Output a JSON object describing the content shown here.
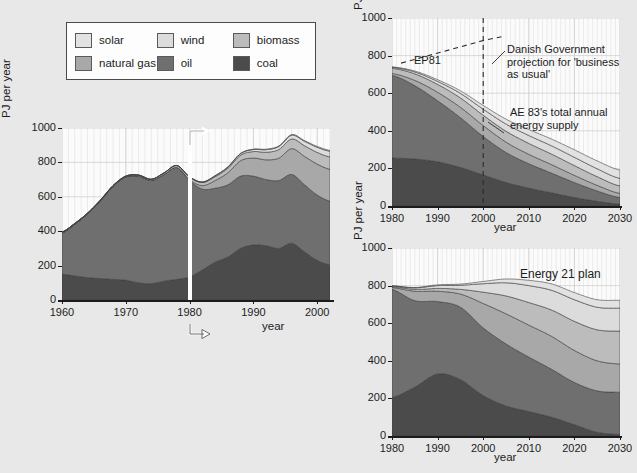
{
  "legend": {
    "name": "energy-source-legend",
    "rows": [
      [
        {
          "label": "solar",
          "color": "#e2e2e2",
          "icon": "swatch-solar"
        },
        {
          "label": "wind",
          "color": "#dcdcdc",
          "icon": "swatch-wind"
        },
        {
          "label": "biomass",
          "color": "#bcbcbc",
          "icon": "swatch-biomass"
        }
      ],
      [
        {
          "label": "natural gas",
          "color": "#a8a8a8",
          "icon": "swatch-natural-gas"
        },
        {
          "label": "oil",
          "color": "#6f6f6f",
          "icon": "swatch-oil"
        },
        {
          "label": "coal",
          "color": "#4b4b4b",
          "icon": "swatch-coal"
        }
      ]
    ]
  },
  "colors": {
    "coal": "#4b4b4b",
    "oil": "#6f6f6f",
    "natural_gas": "#a8a8a8",
    "biomass": "#bcbcbc",
    "wind": "#dcdcdc",
    "solar": "#e2e2e2",
    "plot_bg": "#fbfbfb",
    "page_bg": "#e8e8e8",
    "axis": "#1c1c1c",
    "grid": "#cfcfcf",
    "marker": "#ffffff"
  },
  "main_chart": {
    "name": "danish-energy-history-chart",
    "ylabel": "PJ per year",
    "xlabel": "year",
    "marker_year": 1980,
    "marker_label": "1980-marker-line"
  },
  "ae83_chart": {
    "name": "ae83-scenario-chart",
    "ylabel": "PJ per year",
    "xlabel": "year",
    "annotations": [
      {
        "name": "ep81-label",
        "text": "EP81"
      },
      {
        "name": "business-as-usual-label",
        "text": "Danish Government\nprojection for 'business\nas usual'"
      },
      {
        "name": "ae83-total-supply-label",
        "text": "AE 83's total annual\nenergy supply"
      }
    ]
  },
  "energy21_chart": {
    "name": "energy-21-plan-chart",
    "ylabel": "PJ per year",
    "xlabel": "year",
    "annotations": [
      {
        "name": "energy-21-plan-label",
        "text": "Energy 21 plan"
      }
    ]
  },
  "chart_data": [
    {
      "type": "area",
      "name": "main_chart",
      "title": "",
      "xlabel": "year",
      "ylabel": "PJ per year",
      "xlim": [
        1960,
        2002
      ],
      "ylim": [
        0,
        1000
      ],
      "yticks": [
        0,
        200,
        400,
        600,
        800,
        1000
      ],
      "xticks": [
        1960,
        1970,
        1980,
        1990,
        2000
      ],
      "grid": true,
      "legend_position": "top-left-external",
      "stacked": true,
      "x": [
        1960,
        1962,
        1964,
        1966,
        1968,
        1970,
        1972,
        1974,
        1976,
        1978,
        1980,
        1982,
        1984,
        1986,
        1988,
        1990,
        1992,
        1994,
        1996,
        1998,
        2000,
        2002
      ],
      "series": [
        {
          "name": "coal",
          "values": [
            150,
            140,
            130,
            125,
            120,
            115,
            100,
            95,
            110,
            120,
            135,
            175,
            220,
            250,
            300,
            320,
            315,
            300,
            330,
            280,
            230,
            205
          ]
        },
        {
          "name": "oil",
          "values": [
            240,
            300,
            370,
            450,
            540,
            600,
            620,
            600,
            620,
            650,
            560,
            470,
            430,
            420,
            420,
            400,
            385,
            395,
            400,
            390,
            380,
            370
          ]
        },
        {
          "name": "natural gas",
          "values": [
            0,
            0,
            0,
            0,
            0,
            0,
            0,
            0,
            0,
            0,
            5,
            20,
            45,
            70,
            90,
            105,
            115,
            130,
            150,
            165,
            180,
            185
          ]
        },
        {
          "name": "biomass",
          "values": [
            5,
            5,
            5,
            5,
            5,
            5,
            6,
            7,
            9,
            11,
            14,
            18,
            22,
            26,
            32,
            38,
            44,
            50,
            56,
            62,
            68,
            72
          ]
        },
        {
          "name": "wind",
          "values": [
            0,
            0,
            0,
            0,
            0,
            0,
            0,
            0,
            0,
            1,
            2,
            3,
            5,
            7,
            9,
            12,
            15,
            18,
            22,
            26,
            30,
            33
          ]
        },
        {
          "name": "solar",
          "values": [
            0,
            0,
            0,
            0,
            0,
            0,
            0,
            0,
            0,
            0,
            0,
            0,
            1,
            1,
            2,
            2,
            3,
            3,
            4,
            4,
            5,
            5
          ]
        }
      ]
    },
    {
      "type": "area",
      "name": "ae83_chart",
      "title": "",
      "xlabel": "year",
      "ylabel": "PJ per year",
      "xlim": [
        1980,
        2030
      ],
      "ylim": [
        0,
        1000
      ],
      "yticks": [
        0,
        200,
        400,
        600,
        800,
        1000
      ],
      "xticks": [
        1980,
        1990,
        2000,
        2010,
        2020,
        2030
      ],
      "grid": true,
      "stacked": true,
      "x": [
        1980,
        1985,
        1990,
        1995,
        2000,
        2005,
        2010,
        2015,
        2020,
        2025,
        2030
      ],
      "series": [
        {
          "name": "coal",
          "values": [
            255,
            250,
            235,
            205,
            165,
            125,
            95,
            70,
            45,
            25,
            10
          ]
        },
        {
          "name": "oil",
          "values": [
            440,
            390,
            325,
            265,
            205,
            160,
            130,
            105,
            80,
            55,
            35
          ]
        },
        {
          "name": "natural gas",
          "values": [
            10,
            28,
            45,
            55,
            58,
            55,
            50,
            45,
            38,
            30,
            22
          ]
        },
        {
          "name": "biomass",
          "values": [
            28,
            35,
            42,
            50,
            55,
            58,
            58,
            56,
            52,
            46,
            40
          ]
        },
        {
          "name": "wind",
          "values": [
            5,
            10,
            16,
            24,
            32,
            38,
            42,
            44,
            44,
            42,
            40
          ]
        },
        {
          "name": "solar",
          "values": [
            2,
            5,
            9,
            14,
            20,
            26,
            32,
            36,
            40,
            42,
            44
          ]
        }
      ],
      "reference_lines": [
        {
          "name": "EP81",
          "style": "dashed",
          "x": [
            1982,
            2000,
            2004
          ],
          "y": [
            760,
            880,
            900
          ]
        },
        {
          "name": "projection-divider",
          "style": "dashed-vertical",
          "x": 2000
        }
      ]
    },
    {
      "type": "area",
      "name": "energy21_chart",
      "title": "Energy 21 plan",
      "xlabel": "year",
      "ylabel": "PJ per year",
      "xlim": [
        1980,
        2030
      ],
      "ylim": [
        0,
        1000
      ],
      "yticks": [
        0,
        200,
        400,
        600,
        800,
        1000
      ],
      "xticks": [
        1980,
        1990,
        2000,
        2010,
        2020,
        2030
      ],
      "grid": true,
      "stacked": true,
      "x": [
        1980,
        1985,
        1990,
        1995,
        2000,
        2005,
        2010,
        2015,
        2020,
        2025,
        2030
      ],
      "series": [
        {
          "name": "coal",
          "values": [
            205,
            260,
            330,
            300,
            215,
            160,
            130,
            100,
            60,
            20,
            8
          ]
        },
        {
          "name": "oil",
          "values": [
            575,
            460,
            385,
            385,
            360,
            330,
            290,
            255,
            225,
            220,
            225
          ]
        },
        {
          "name": "natural gas",
          "values": [
            10,
            50,
            55,
            70,
            130,
            160,
            170,
            175,
            170,
            160,
            150
          ]
        },
        {
          "name": "biomass",
          "values": [
            5,
            10,
            15,
            25,
            60,
            95,
            120,
            140,
            155,
            165,
            175
          ]
        },
        {
          "name": "wind",
          "values": [
            3,
            8,
            15,
            22,
            45,
            70,
            90,
            105,
            115,
            120,
            122
          ]
        },
        {
          "name": "solar",
          "values": [
            1,
            2,
            4,
            6,
            12,
            20,
            28,
            34,
            38,
            40,
            42
          ]
        }
      ]
    }
  ]
}
